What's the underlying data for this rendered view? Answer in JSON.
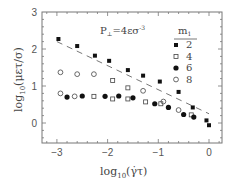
{
  "chart_data": {
    "type": "scatter",
    "title": "",
    "annotation": "P⊥=4εσ⁻³",
    "annotation_parts": {
      "main": "P",
      "sub": "⊥",
      "rest": "=4εσ",
      "sup": "-3"
    },
    "xlabel": "log10(γ̇τ)",
    "xlabel_parts": {
      "pre": "log",
      "sub": "10",
      "post": "(γ̇τ)"
    },
    "ylabel": "log10(μετ/σ)",
    "ylabel_parts": {
      "pre": "log",
      "sub": "10",
      "post": "(μετ/σ)"
    },
    "xlim": [
      -3.3,
      0.25
    ],
    "ylim": [
      -0.5,
      3
    ],
    "xticks": [
      "-3",
      "-2",
      "-1",
      "0"
    ],
    "yticks": [
      "0",
      "1",
      "2",
      "3"
    ],
    "grid": false,
    "legend": {
      "title": "m",
      "title_sub": "1",
      "position": "upper right",
      "entries": [
        "2",
        "4",
        "6",
        "8"
      ]
    },
    "series": [
      {
        "name": "2",
        "marker": "filled-square",
        "points": [
          [
            -2.97,
            2.27
          ],
          [
            -2.6,
            2.08
          ],
          [
            -2.25,
            1.82
          ],
          [
            -1.97,
            1.68
          ],
          [
            -1.6,
            1.43
          ],
          [
            -1.3,
            1.28
          ],
          [
            -0.97,
            1.12
          ],
          [
            -0.6,
            0.84
          ],
          [
            -0.32,
            0.42
          ],
          [
            -0.05,
            0.07
          ],
          [
            0.0,
            -0.06
          ]
        ]
      },
      {
        "name": "4",
        "marker": "open-square",
        "points": [
          [
            -2.27,
            0.72
          ],
          [
            -1.9,
            1.15
          ],
          [
            -1.9,
            0.65
          ],
          [
            -1.6,
            0.95
          ],
          [
            -1.6,
            0.65
          ],
          [
            -1.25,
            0.57
          ],
          [
            -0.95,
            0.52
          ],
          [
            -0.35,
            0.22
          ]
        ]
      },
      {
        "name": "6",
        "marker": "filled-circle",
        "points": [
          [
            -2.8,
            0.7
          ],
          [
            -2.5,
            0.73
          ],
          [
            -2.05,
            0.72
          ],
          [
            -1.78,
            0.73
          ],
          [
            -1.5,
            0.68
          ],
          [
            -1.07,
            0.52
          ],
          [
            -0.8,
            0.42
          ],
          [
            -0.5,
            0.23
          ],
          [
            -0.3,
            0.16
          ]
        ]
      },
      {
        "name": "8",
        "marker": "open-circle",
        "points": [
          [
            -2.93,
            1.37
          ],
          [
            -2.6,
            1.32
          ],
          [
            -2.27,
            1.32
          ],
          [
            -2.93,
            0.8
          ],
          [
            -2.65,
            0.72
          ],
          [
            -1.3,
            0.87
          ],
          [
            -0.9,
            0.58
          ],
          [
            -0.6,
            0.35
          ]
        ]
      }
    ],
    "fit_line": {
      "style": "dashed",
      "from": [
        -3.0,
        2.2
      ],
      "to": [
        0.0,
        0.25
      ]
    }
  }
}
